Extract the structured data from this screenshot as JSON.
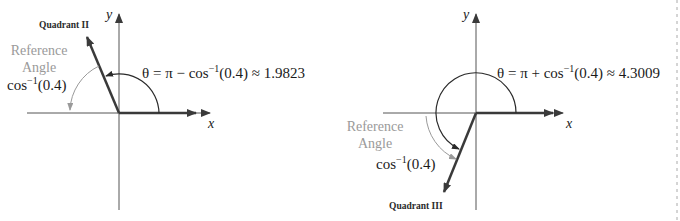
{
  "colors": {
    "axis": "#3a3a3a",
    "vector": "#3a3a3a",
    "theta_arc": "#2a2a2a",
    "reference": "#9a9a9a",
    "text": "#1a1a1a",
    "border_dash": "#aaaaaa"
  },
  "left_panel": {
    "quadrant_label": "Quadrant II",
    "axis_x_label": "x",
    "axis_y_label": "y",
    "reference_label_line1": "Reference",
    "reference_label_line2": "Angle",
    "reference_value_prefix": "cos",
    "reference_value_sup": "−1",
    "reference_value_suffix": "(0.4)",
    "theta_prefix": "θ = π − cos",
    "theta_sup": "−1",
    "theta_suffix": "(0.4) ≈ 1.9823"
  },
  "right_panel": {
    "quadrant_label": "Quadrant III",
    "axis_x_label": "x",
    "axis_y_label": "y",
    "reference_label_line1": "Reference",
    "reference_label_line2": "Angle",
    "reference_value_prefix": "cos",
    "reference_value_sup": "−1",
    "reference_value_suffix": "(0.4)",
    "theta_prefix": "θ = π + cos",
    "theta_sup": "−1",
    "theta_suffix": "(0.4) ≈ 4.3009"
  }
}
